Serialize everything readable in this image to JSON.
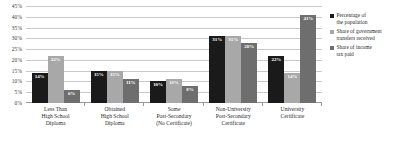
{
  "chart_data": {
    "type": "bar",
    "title": "",
    "xlabel": "",
    "ylabel": "",
    "ylim": [
      0,
      45
    ],
    "grid": true,
    "legend_position": "right",
    "categories": [
      "Less Than High School Diploma",
      "Obtained High School Diploma",
      "Some Post-Secondary (No Certificate)",
      "Non-University Post-Secondary Certificate",
      "University Certificate"
    ],
    "category_lines": [
      [
        "Less Than",
        "High School",
        "Diploma"
      ],
      [
        "Obtained",
        "High School",
        "Diploma"
      ],
      [
        "Some",
        "Post-Secondary",
        "(No Certificate)"
      ],
      [
        "Non-University",
        "Post-Secondary",
        "Certificate"
      ],
      [
        "University",
        "Certificate"
      ]
    ],
    "ticks": [
      "0%",
      "5%",
      "10%",
      "15%",
      "20%",
      "25%",
      "30%",
      "35%",
      "40%",
      "45%"
    ],
    "tick_values": [
      0,
      5,
      10,
      15,
      20,
      25,
      30,
      35,
      40,
      45
    ],
    "series": [
      {
        "name": "Percentage of the population",
        "name_lines": [
          "Percentage of",
          "the population"
        ],
        "color": "#1a1a1a",
        "values": [
          14,
          15,
          10,
          31,
          22
        ],
        "labels": [
          "14%",
          "15%",
          "10%",
          "31%",
          "22%"
        ]
      },
      {
        "name": "Share of government transfers received",
        "name_lines": [
          "Share of government",
          "transfers received"
        ],
        "color": "#a8a8a8",
        "values": [
          22,
          15,
          11,
          31,
          14
        ],
        "labels": [
          "22%",
          "15%",
          "11%",
          "31%",
          "14%"
        ]
      },
      {
        "name": "Share of income tax paid",
        "name_lines": [
          "Share of income",
          "tax paid"
        ],
        "color": "#6e6e6e",
        "values": [
          6,
          11,
          8,
          28,
          41
        ],
        "labels": [
          "6%",
          "11%",
          "8%",
          "28%",
          "41%"
        ]
      }
    ]
  }
}
